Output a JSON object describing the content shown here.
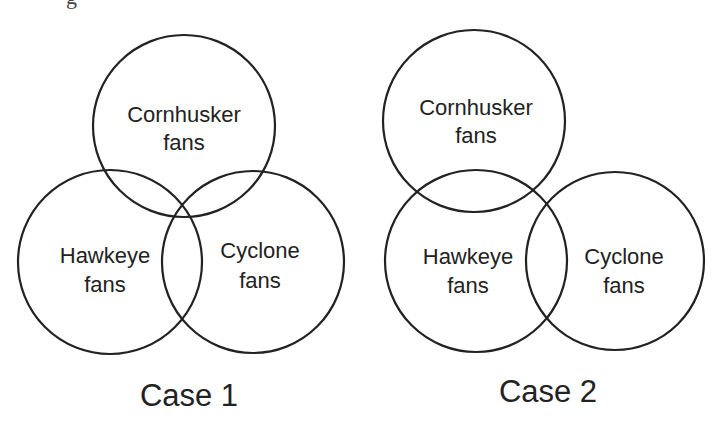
{
  "header": {
    "cut_off_text_fragment": "g"
  },
  "colors": {
    "stroke": "#222222",
    "text": "#222222",
    "background": "#ffffff"
  },
  "diagrams": [
    {
      "case_label": "Case 1",
      "sets": {
        "cornhusker": {
          "line1": "Cornhusker",
          "line2": "fans"
        },
        "hawkeye": {
          "line1": "Hawkeye",
          "line2": "fans"
        },
        "cyclone": {
          "line1": "Cyclone",
          "line2": "fans"
        }
      },
      "description": "Three mutually overlapping circles; all pairs intersect and a common triple-overlap region exists."
    },
    {
      "case_label": "Case 2",
      "sets": {
        "cornhusker": {
          "line1": "Cornhusker",
          "line2": "fans"
        },
        "hawkeye": {
          "line1": "Hawkeye",
          "line2": "fans"
        },
        "cyclone": {
          "line1": "Cyclone",
          "line2": "fans"
        }
      },
      "description": "Cornhusker overlaps Hawkeye, Hawkeye overlaps Cyclone; Cornhusker and Cyclone do not share a common region with all three."
    }
  ]
}
